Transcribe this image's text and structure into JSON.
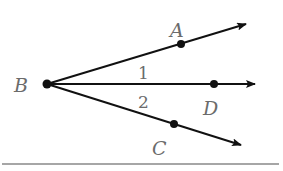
{
  "diagram": {
    "type": "angle-bisector-rays",
    "vertex": {
      "label": "B",
      "x": 47,
      "y": 84
    },
    "rays": [
      {
        "name": "BA",
        "point": {
          "label": "A",
          "x": 181,
          "y": 44
        },
        "tip": {
          "x": 246,
          "y": 24
        },
        "label_pos": {
          "x": 176,
          "y": 37
        }
      },
      {
        "name": "BD",
        "point": {
          "label": "D",
          "x": 214,
          "y": 84
        },
        "tip": {
          "x": 255,
          "y": 84
        },
        "label_pos": {
          "x": 210,
          "y": 115
        }
      },
      {
        "name": "BC",
        "point": {
          "label": "C",
          "x": 174,
          "y": 124
        },
        "tip": {
          "x": 241,
          "y": 145
        },
        "label_pos": {
          "x": 158,
          "y": 155
        }
      }
    ],
    "angle_labels": [
      {
        "text": "1",
        "x": 138,
        "y": 79
      },
      {
        "text": "2",
        "x": 138,
        "y": 108
      }
    ],
    "vertex_label_pos": {
      "x": 14,
      "y": 92
    },
    "baseline": {
      "x1": 2,
      "y1": 164,
      "x2": 279,
      "y2": 164
    },
    "colors": {
      "stroke": "#111111",
      "label": "#6b6b6b",
      "baseline": "#888888"
    }
  }
}
